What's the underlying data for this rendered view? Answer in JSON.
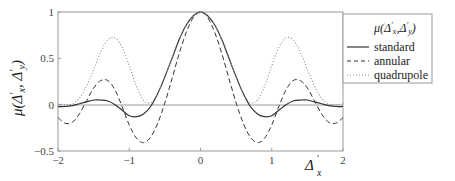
{
  "chart_data": {
    "type": "line",
    "title": "",
    "xlabel": "Δ'_x",
    "ylabel": "μ(Δ'_x, Δ'_y)",
    "xlim": [
      -2,
      2
    ],
    "ylim": [
      -0.5,
      1
    ],
    "x_ticks": [
      "-2",
      "-1",
      "0",
      "1",
      "2"
    ],
    "y_ticks": [
      "-0.5",
      "0",
      "0.5",
      "1"
    ],
    "grid": false,
    "zero_line": true,
    "legend": {
      "title": "μ(Δ'_x, Δ'_y)",
      "position": "right-outside",
      "entries": [
        "standard",
        "annular",
        "quadrupole"
      ]
    },
    "x": [
      -2,
      -1.9,
      -1.8,
      -1.7,
      -1.6,
      -1.5,
      -1.4,
      -1.3,
      -1.2,
      -1.1,
      -1,
      -0.9,
      -0.8,
      -0.7,
      -0.6,
      -0.5,
      -0.4,
      -0.3,
      -0.2,
      -0.1,
      0,
      0.1,
      0.2,
      0.3,
      0.4,
      0.5,
      0.6,
      0.7,
      0.8,
      0.9,
      1,
      1.1,
      1.2,
      1.3,
      1.4,
      1.5,
      1.6,
      1.7,
      1.8,
      1.9,
      2
    ],
    "series": [
      {
        "name": "standard",
        "style": "solid",
        "values": [
          -0.02,
          -0.02,
          -0.01,
          0.01,
          0.03,
          0.05,
          0.05,
          0.04,
          0.0,
          -0.06,
          -0.12,
          -0.13,
          -0.1,
          -0.02,
          0.12,
          0.3,
          0.5,
          0.7,
          0.86,
          0.96,
          1,
          0.96,
          0.86,
          0.7,
          0.5,
          0.3,
          0.12,
          -0.02,
          -0.1,
          -0.13,
          -0.12,
          -0.06,
          0.0,
          0.04,
          0.05,
          0.05,
          0.03,
          0.01,
          -0.01,
          -0.02,
          -0.02
        ]
      },
      {
        "name": "annular",
        "style": "dashed",
        "values": [
          -0.14,
          -0.2,
          -0.19,
          -0.1,
          0.04,
          0.18,
          0.26,
          0.26,
          0.16,
          -0.02,
          -0.22,
          -0.36,
          -0.41,
          -0.35,
          -0.2,
          0.02,
          0.28,
          0.55,
          0.78,
          0.94,
          1,
          0.94,
          0.78,
          0.55,
          0.28,
          0.02,
          -0.2,
          -0.35,
          -0.41,
          -0.36,
          -0.22,
          -0.02,
          0.16,
          0.26,
          0.26,
          0.18,
          0.04,
          -0.1,
          -0.19,
          -0.2,
          -0.14
        ]
      },
      {
        "name": "quadrupole",
        "style": "dotted",
        "values": [
          0.01,
          0.0,
          0.01,
          0.07,
          0.2,
          0.38,
          0.57,
          0.7,
          0.72,
          0.62,
          0.42,
          0.2,
          0.05,
          0.02,
          0.12,
          0.3,
          0.5,
          0.7,
          0.86,
          0.96,
          1,
          0.96,
          0.86,
          0.7,
          0.5,
          0.3,
          0.12,
          0.02,
          0.05,
          0.2,
          0.42,
          0.62,
          0.72,
          0.7,
          0.57,
          0.38,
          0.2,
          0.07,
          0.01,
          0.0,
          0.01
        ]
      }
    ]
  },
  "labels": {
    "ylabel_mu": "μ",
    "ylabel_args": "(Δ′x, Δ′y)",
    "xlabel_delta": "Δ′",
    "xlabel_sub": "x",
    "legend_title": "μ(Δ′x,Δ′y)",
    "legend_standard": "standard",
    "legend_annular": "annular",
    "legend_quadrupole": "quadrupole"
  },
  "colors": {
    "axis": "#9a9a9a",
    "curve": "#333333",
    "dotted": "#8a8a8a"
  }
}
